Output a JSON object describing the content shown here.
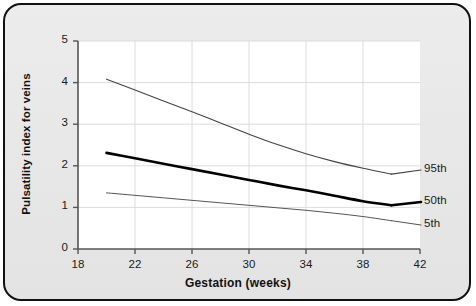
{
  "chart_data": {
    "type": "line",
    "title": "",
    "xlabel": "Gestation (weeks)",
    "ylabel": "Pulsatility index for veins",
    "xlim": [
      18,
      42
    ],
    "ylim": [
      0,
      5
    ],
    "xticks": [
      18,
      22,
      26,
      30,
      34,
      38,
      42
    ],
    "yticks": [
      0,
      1,
      2,
      3,
      4,
      5
    ],
    "grid": true,
    "legend_position": "inline-right",
    "x": [
      20,
      22,
      24,
      26,
      28,
      30,
      32,
      34,
      36,
      38,
      40
    ],
    "series": [
      {
        "name": "95th",
        "label": "95th",
        "color": "#444444",
        "width": 1.1,
        "values": [
          4.08,
          3.82,
          3.56,
          3.3,
          3.03,
          2.76,
          2.51,
          2.29,
          2.1,
          1.94,
          1.8
        ]
      },
      {
        "name": "50th",
        "label": "50th",
        "color": "#000000",
        "width": 2.6,
        "values": [
          2.31,
          2.18,
          2.05,
          1.92,
          1.79,
          1.66,
          1.53,
          1.41,
          1.28,
          1.15,
          1.05
        ]
      },
      {
        "name": "5th",
        "label": "5th",
        "color": "#555555",
        "width": 1.0,
        "values": [
          1.35,
          1.29,
          1.23,
          1.17,
          1.11,
          1.05,
          0.99,
          0.93,
          0.86,
          0.78,
          0.68
        ]
      }
    ]
  },
  "axes": {
    "x_tick_labels": [
      "18",
      "22",
      "26",
      "30",
      "34",
      "38",
      "42"
    ],
    "y_tick_labels": [
      "0",
      "1",
      "2",
      "3",
      "4",
      "5"
    ],
    "x_title": "Gestation (weeks)",
    "y_title": "Pulsatility index for veins"
  },
  "series_labels": {
    "p95": "95th",
    "p50": "50th",
    "p5": "5th"
  },
  "colors": {
    "frame_border": "#111111",
    "panel_background": "#e9e9e9",
    "plot_background": "#ffffff",
    "grid": "#d8d8d8",
    "axis": "#555555",
    "text": "#111111"
  }
}
